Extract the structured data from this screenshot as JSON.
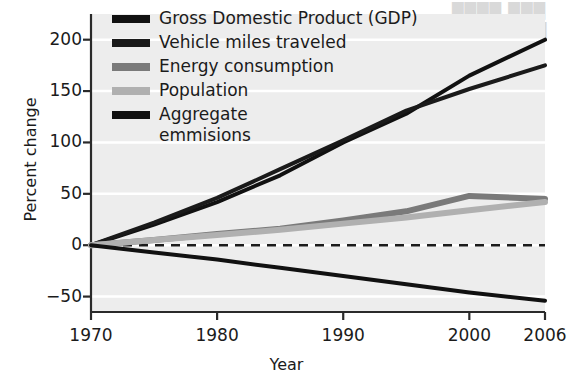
{
  "chart_data": {
    "type": "line",
    "title": "",
    "xlabel": "Year",
    "ylabel": "Percent change",
    "xlim": [
      1970,
      2006
    ],
    "ylim": [
      -65,
      225
    ],
    "xticks": [
      1970,
      1980,
      1990,
      2000,
      2006
    ],
    "xtick_labels": [
      "1970",
      "1980",
      "1990",
      "2000",
      "2006"
    ],
    "yticks": [
      -50,
      0,
      50,
      100,
      150,
      200
    ],
    "ytick_labels": [
      "−50",
      "0",
      "50",
      "100",
      "150",
      "200"
    ],
    "grid": "horizontal-white-gridlines",
    "plot_background": "#ededed",
    "zero_reference_line": {
      "value": 0,
      "style": "dashed",
      "color": "#1b1b1b"
    },
    "legend_position": "upper-left-inside",
    "x": [
      1970,
      1975,
      1980,
      1985,
      1990,
      1995,
      2000,
      2006
    ],
    "series": [
      {
        "name": "Gross Domestic Product (GDP)",
        "color": "#111111",
        "width": 4,
        "values": [
          0,
          20,
          42,
          68,
          100,
          128,
          165,
          200
        ]
      },
      {
        "name": "Vehicle miles traveled",
        "color": "#1a1a1a",
        "width": 4,
        "values": [
          0,
          22,
          46,
          74,
          102,
          131,
          152,
          175
        ]
      },
      {
        "name": "Energy consumption",
        "color": "#7a7a7a",
        "width": 6,
        "values": [
          0,
          5,
          11,
          16,
          24,
          33,
          48,
          45
        ]
      },
      {
        "name": "Population",
        "color": "#b0b0b0",
        "width": 6,
        "values": [
          0,
          5,
          10,
          15,
          21,
          27,
          34,
          42
        ]
      },
      {
        "name": "Aggregate\nemmisions",
        "color": "#111111",
        "width": 4,
        "values": [
          0,
          -7,
          -14,
          -22,
          -30,
          -38,
          -46,
          -54
        ]
      }
    ]
  },
  "legend": {
    "items": [
      {
        "label": "Gross Domestic Product (GDP)",
        "color": "#111111"
      },
      {
        "label": "Vehicle miles traveled",
        "color": "#1a1a1a"
      },
      {
        "label": "Energy consumption",
        "color": "#7a7a7a"
      },
      {
        "label": "Population",
        "color": "#b0b0b0"
      },
      {
        "label": "Aggregate\nemmisions",
        "color": "#111111"
      }
    ]
  },
  "axes": {
    "x_title": "Year",
    "y_title": "Percent change"
  },
  "ghost_text": {
    "line1": "\b\b\b",
    "line2": "\b\b"
  }
}
